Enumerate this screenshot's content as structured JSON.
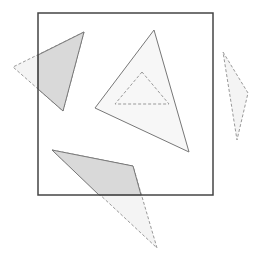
{
  "diagram": {
    "title": "",
    "canvas": {
      "width": 261,
      "height": 262,
      "background": "#ffffff"
    },
    "colors": {
      "clip_window_stroke": "#444444",
      "solid_stroke": "#777777",
      "dashed_stroke": "#999999",
      "inside_fill": "#d9d9d9",
      "outside_fill": "#f4f4f4",
      "contained_fill": "#f7f7f7"
    },
    "clip_window": {
      "x": 38,
      "y": 13,
      "width": 175,
      "height": 182
    },
    "shapes": [
      {
        "id": "left-triangle",
        "points": [
          [
            84,
            32
          ],
          [
            13,
            67
          ],
          [
            63,
            111
          ]
        ],
        "clipped_inside": [
          [
            84,
            32
          ],
          [
            38,
            55
          ],
          [
            38,
            89
          ],
          [
            63,
            111
          ]
        ],
        "status": "partially-inside"
      },
      {
        "id": "center-triangle",
        "points": [
          [
            154,
            30
          ],
          [
            95,
            108
          ],
          [
            189,
            152
          ]
        ],
        "status": "fully-inside"
      },
      {
        "id": "inner-dashed-triangle",
        "points": [
          [
            142,
            72
          ],
          [
            115,
            104
          ],
          [
            169,
            104
          ]
        ],
        "status": "hole-or-inner"
      },
      {
        "id": "right-triangle",
        "points": [
          [
            223,
            52
          ],
          [
            248,
            93
          ],
          [
            237,
            140
          ]
        ],
        "status": "fully-outside"
      },
      {
        "id": "bottom-triangle",
        "points": [
          [
            52,
            150
          ],
          [
            133,
            166
          ],
          [
            157,
            248
          ]
        ],
        "clipped_inside": [
          [
            52,
            150
          ],
          [
            133,
            166
          ],
          [
            141,
            195
          ],
          [
            99,
            195
          ]
        ],
        "status": "partially-inside"
      }
    ]
  }
}
